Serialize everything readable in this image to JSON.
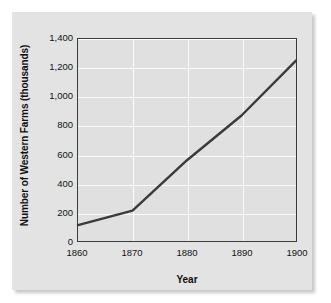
{
  "chart_data": {
    "type": "line",
    "title": "",
    "xlabel": "Year",
    "ylabel": "Number of Western Farms (thousands)",
    "x": [
      1860,
      1870,
      1880,
      1890,
      1900
    ],
    "xticklabels": [
      "1860",
      "1870",
      "1880",
      "1890",
      "1900"
    ],
    "values": [
      110,
      210,
      560,
      870,
      1250
    ],
    "series": [
      {
        "name": "Number of Western Farms (thousands)",
        "values": [
          110,
          210,
          560,
          870,
          1250
        ]
      }
    ],
    "yticks": [
      0,
      200,
      400,
      600,
      800,
      1000,
      1200,
      1400
    ],
    "yticklabels": [
      "0",
      "200",
      "400",
      "600",
      "800",
      "1,000",
      "1,200",
      "1,400"
    ],
    "xlim": [
      1860,
      1900
    ],
    "ylim": [
      0,
      1400
    ],
    "grid": true,
    "legend": false,
    "legend_position": "none",
    "colors": {
      "line": "#3a3a3a",
      "plot_background": "#e0e0e0",
      "figure_background": "#e3e3e3",
      "gridline": "#fbfbfb",
      "axis": "#3c3c3c",
      "text": "#131313",
      "page_background": "#ffffff"
    }
  }
}
